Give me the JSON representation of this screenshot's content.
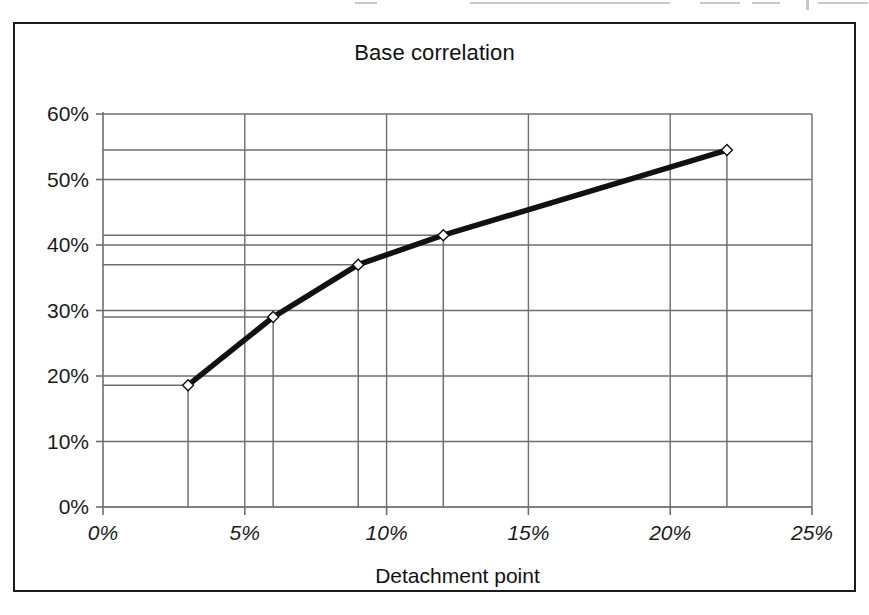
{
  "figure": {
    "title": "Base correlation",
    "marker_style": "open-diamond",
    "line_color": "#111111",
    "grid_color": "#6e6e6e",
    "frame_color": "#1c1c1c",
    "background": "#ffffff"
  },
  "chart_data": {
    "type": "line",
    "title": "Base correlation",
    "xlabel": "Detachment point",
    "ylabel": "",
    "xlim": [
      0,
      25
    ],
    "ylim": [
      0,
      60
    ],
    "grid": true,
    "legend": "none",
    "x_unit": "%",
    "y_unit": "%",
    "x_ticks": [
      0,
      5,
      10,
      15,
      20,
      25
    ],
    "x_tick_labels": [
      "0%",
      "5%",
      "10%",
      "15%",
      "20%",
      "25%"
    ],
    "y_ticks": [
      0,
      10,
      20,
      30,
      40,
      50,
      60
    ],
    "y_tick_labels": [
      "0%",
      "10%",
      "20%",
      "30%",
      "40%",
      "50%",
      "60%"
    ],
    "series": [
      {
        "name": "Base correlation",
        "x": [
          3,
          6,
          9,
          12,
          22
        ],
        "y": [
          18.6,
          29.0,
          37.0,
          41.5,
          54.5
        ],
        "points": [
          {
            "x": 3,
            "y": 18.6,
            "x_label": "3%",
            "y_label": "18.6%"
          },
          {
            "x": 6,
            "y": 29.0,
            "x_label": "6%",
            "y_label": "29%"
          },
          {
            "x": 9,
            "y": 37.0,
            "x_label": "9%",
            "y_label": "37%"
          },
          {
            "x": 12,
            "y": 41.5,
            "x_label": "12%",
            "y_label": "41.5%"
          },
          {
            "x": 22,
            "y": 54.5,
            "x_label": "22%",
            "y_label": "54.5%"
          }
        ]
      }
    ],
    "leader_lines": {
      "description": "drop lines from each marker to both axes",
      "y_values": [
        18.6,
        29.0,
        37.0,
        41.5,
        54.5
      ],
      "x_values": [
        3,
        6,
        9,
        12,
        22
      ]
    }
  }
}
